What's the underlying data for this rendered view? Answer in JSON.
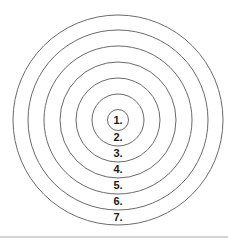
{
  "diagram": {
    "type": "concentric-circles",
    "center": {
      "x": 118,
      "y": 120
    },
    "stroke_color": "#6b6b6b",
    "label_color": "#1a1a1a",
    "rings": [
      {
        "label": "1.",
        "radius": 10.5,
        "label_y": 123.5
      },
      {
        "label": "2.",
        "radius": 26,
        "label_y": 141
      },
      {
        "label": "3.",
        "radius": 42,
        "label_y": 157
      },
      {
        "label": "4.",
        "radius": 58,
        "label_y": 173
      },
      {
        "label": "5.",
        "radius": 74,
        "label_y": 189
      },
      {
        "label": "6.",
        "radius": 90,
        "label_y": 205
      },
      {
        "label": "7.",
        "radius": 105,
        "label_y": 221
      }
    ]
  },
  "divider_color": "#d4d4d4"
}
